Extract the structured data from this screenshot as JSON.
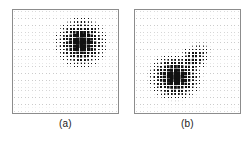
{
  "figure": {
    "width": 251,
    "height": 141,
    "background_color": "#ffffff",
    "dot_color": "#111111",
    "frame_color": "#8c8c8c",
    "caption_color": "#1a1a1a"
  },
  "panels": [
    {
      "id": "panel-a",
      "caption": "(a)",
      "left": 12,
      "top": 9,
      "width": 107,
      "height": 105,
      "caption_top": 118
    },
    {
      "id": "panel-b",
      "caption": "(b)",
      "left": 134,
      "top": 9,
      "width": 107,
      "height": 105,
      "caption_top": 118
    }
  ],
  "chart_data": [
    {
      "type": "heatmap",
      "title": "(a)",
      "xlabel": "",
      "ylabel": "",
      "grid": true,
      "legend": "none",
      "encoding": "dot-area",
      "grid_cols": 30,
      "grid_rows": 30,
      "x": [
        0,
        1,
        2,
        3,
        4,
        5,
        6,
        7,
        8,
        9,
        10,
        11,
        12,
        13,
        14,
        15,
        16,
        17,
        18,
        19,
        20,
        21,
        22,
        23,
        24,
        25,
        26,
        27,
        28,
        29
      ],
      "y": [
        0,
        1,
        2,
        3,
        4,
        5,
        6,
        7,
        8,
        9,
        10,
        11,
        12,
        13,
        14,
        15,
        16,
        17,
        18,
        19,
        20,
        21,
        22,
        23,
        24,
        25,
        26,
        27,
        28,
        29
      ],
      "zlim": [
        0,
        1
      ],
      "blobs": [
        {
          "name": "primary-cluster",
          "center_col": 19.0,
          "center_row": 9.0,
          "sigma_col": 3.4,
          "sigma_row": 3.4,
          "rotation_deg": 0,
          "amplitude": 1.0
        }
      ],
      "background_level": 0.05
    },
    {
      "type": "heatmap",
      "title": "(b)",
      "xlabel": "",
      "ylabel": "",
      "grid": true,
      "legend": "none",
      "encoding": "dot-area",
      "grid_cols": 30,
      "grid_rows": 30,
      "x": [
        0,
        1,
        2,
        3,
        4,
        5,
        6,
        7,
        8,
        9,
        10,
        11,
        12,
        13,
        14,
        15,
        16,
        17,
        18,
        19,
        20,
        21,
        22,
        23,
        24,
        25,
        26,
        27,
        28,
        29
      ],
      "y": [
        0,
        1,
        2,
        3,
        4,
        5,
        6,
        7,
        8,
        9,
        10,
        11,
        12,
        13,
        14,
        15,
        16,
        17,
        18,
        19,
        20,
        21,
        22,
        23,
        24,
        25,
        26,
        27,
        28,
        29
      ],
      "zlim": [
        0,
        1
      ],
      "blobs": [
        {
          "name": "primary-cluster",
          "center_col": 11.0,
          "center_row": 19.0,
          "sigma_col": 3.6,
          "sigma_row": 3.2,
          "rotation_deg": 0,
          "amplitude": 1.0
        },
        {
          "name": "diagonal-tail",
          "center_col": 15.5,
          "center_row": 14.5,
          "sigma_col": 3.6,
          "sigma_row": 2.0,
          "rotation_deg": -45,
          "amplitude": 0.52
        }
      ],
      "background_level": 0.05
    }
  ]
}
